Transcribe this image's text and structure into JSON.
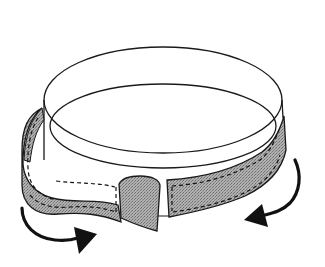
{
  "illustration": {
    "subject": "Band with hook-and-loop strap being wrapped and tightened",
    "colors": {
      "background": "#ffffff",
      "line": "#1a1a1a",
      "strap_fill": "#a9a9a9",
      "strap_stipple": "#8a8a8a",
      "arrow": "#111111"
    },
    "parts": [
      {
        "name": "ring-band",
        "label": "White cylindrical band"
      },
      {
        "name": "strap-left",
        "label": "Gray strap, left section with stitching"
      },
      {
        "name": "strap-tab",
        "label": "Strap end tab"
      },
      {
        "name": "strap-right",
        "label": "Gray strap, right section with stitching"
      },
      {
        "name": "arrow-left",
        "label": "Clockwise arrow (left)"
      },
      {
        "name": "arrow-right",
        "label": "Counter-clockwise arrow (right)"
      }
    ]
  }
}
